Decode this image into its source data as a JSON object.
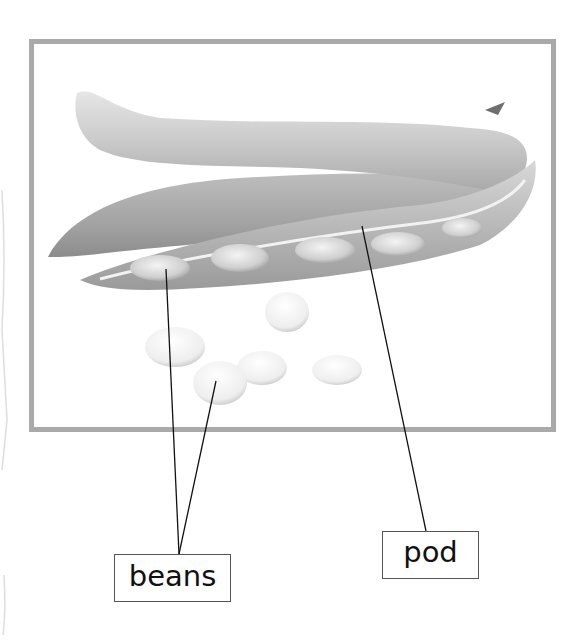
{
  "diagram": {
    "frame_color": "#a9a9a9",
    "labels": [
      {
        "id": "beans",
        "text": "beans",
        "points_to": [
          "bean inside open pod",
          "loose bean"
        ]
      },
      {
        "id": "pod",
        "text": "pod",
        "points_to": [
          "open pod wall"
        ]
      }
    ],
    "leader_line_color": "#111111"
  }
}
